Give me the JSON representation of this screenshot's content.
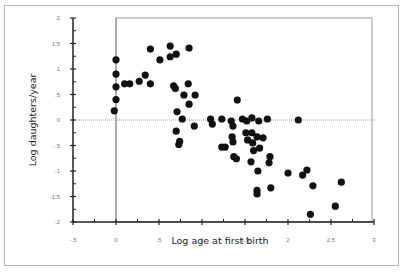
{
  "chart_data": {
    "type": "scatter",
    "title": "",
    "xlabel": "Log age at first birth",
    "ylabel": "Log daughters/year",
    "xlim": [
      -0.5,
      3
    ],
    "ylim": [
      -2,
      2
    ],
    "xticks": [
      "-.5",
      "0",
      ".5",
      "1",
      "1.5",
      "2",
      "2.5",
      "3"
    ],
    "yticks": [
      "2",
      "1.5",
      "1",
      ".5",
      "0",
      "-.5",
      "-1",
      "-1.5",
      "-2"
    ],
    "reference_lines": {
      "x": 0,
      "y": 0
    },
    "grid": false,
    "legend": null,
    "series": [
      {
        "name": "species",
        "points": [
          [
            0.0,
            1.18
          ],
          [
            0.0,
            0.9
          ],
          [
            0.0,
            0.65
          ],
          [
            0.0,
            0.4
          ],
          [
            -0.02,
            0.18
          ],
          [
            0.1,
            0.71
          ],
          [
            0.16,
            0.71
          ],
          [
            0.27,
            0.76
          ],
          [
            0.34,
            0.88
          ],
          [
            0.4,
            0.71
          ],
          [
            0.4,
            1.39
          ],
          [
            0.51,
            1.18
          ],
          [
            0.63,
            1.45
          ],
          [
            0.63,
            1.24
          ],
          [
            0.7,
            1.29
          ],
          [
            0.85,
            1.41
          ],
          [
            0.67,
            0.67
          ],
          [
            0.69,
            0.62
          ],
          [
            0.84,
            0.71
          ],
          [
            0.79,
            0.49
          ],
          [
            0.92,
            0.49
          ],
          [
            0.85,
            0.31
          ],
          [
            0.71,
            0.16
          ],
          [
            0.77,
            0.02
          ],
          [
            0.91,
            -0.12
          ],
          [
            0.7,
            -0.22
          ],
          [
            0.74,
            -0.42
          ],
          [
            0.73,
            -0.48
          ],
          [
            1.1,
            0.02
          ],
          [
            1.12,
            -0.08
          ],
          [
            1.23,
            0.02
          ],
          [
            1.34,
            -0.02
          ],
          [
            1.36,
            -0.12
          ],
          [
            1.47,
            0.02
          ],
          [
            1.52,
            -0.02
          ],
          [
            1.58,
            0.04
          ],
          [
            1.41,
            0.39
          ],
          [
            1.76,
            0.02
          ],
          [
            1.66,
            -0.02
          ],
          [
            1.35,
            -0.33
          ],
          [
            1.36,
            -0.43
          ],
          [
            1.51,
            -0.25
          ],
          [
            1.58,
            -0.25
          ],
          [
            1.53,
            -0.39
          ],
          [
            1.59,
            -0.45
          ],
          [
            1.23,
            -0.53
          ],
          [
            1.27,
            -0.53
          ],
          [
            1.37,
            -0.72
          ],
          [
            1.4,
            -0.76
          ],
          [
            1.57,
            -0.82
          ],
          [
            1.64,
            -0.33
          ],
          [
            1.71,
            -0.35
          ],
          [
            1.67,
            -0.55
          ],
          [
            1.79,
            -0.72
          ],
          [
            1.78,
            -0.84
          ],
          [
            1.6,
            -0.6
          ],
          [
            1.65,
            -1.0
          ],
          [
            1.64,
            -1.38
          ],
          [
            1.64,
            -1.45
          ],
          [
            1.8,
            -1.33
          ],
          [
            2.0,
            -1.04
          ],
          [
            2.17,
            -1.08
          ],
          [
            2.22,
            -0.98
          ],
          [
            2.29,
            -1.29
          ],
          [
            2.62,
            -1.22
          ],
          [
            2.55,
            -1.69
          ],
          [
            2.26,
            -1.85
          ],
          [
            2.12,
            0.0
          ]
        ]
      }
    ]
  }
}
